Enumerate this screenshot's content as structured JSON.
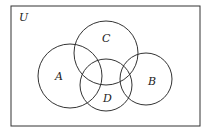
{
  "diagram": {
    "type": "venn",
    "universe": {
      "label": "U",
      "x": 11,
      "y": 6,
      "w": 189,
      "h": 120,
      "label_x": 20,
      "label_y": 21
    },
    "stroke_color": "#333333",
    "sets": [
      {
        "id": "A",
        "label": "A",
        "cx": 70,
        "cy": 76,
        "r": 32,
        "label_x": 58,
        "label_y": 80
      },
      {
        "id": "C",
        "label": "C",
        "cx": 106,
        "cy": 53,
        "r": 32,
        "label_x": 103,
        "label_y": 42
      },
      {
        "id": "D",
        "label": "D",
        "cx": 106,
        "cy": 85,
        "r": 26,
        "label_x": 104,
        "label_y": 102
      },
      {
        "id": "B",
        "label": "B",
        "cx": 146,
        "cy": 79,
        "r": 26,
        "label_x": 149,
        "label_y": 85
      }
    ]
  }
}
